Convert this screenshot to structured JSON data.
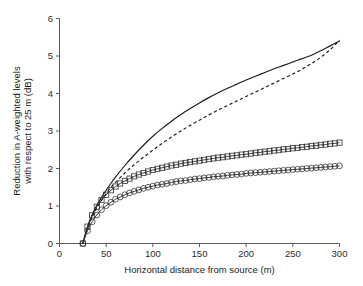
{
  "chart_data": {
    "type": "line",
    "title": "",
    "subtitle": "",
    "xlabel": "Horizontal distance from source (m)",
    "ylabel": "Reduction in A-weighted levels\nwith respect to 25 m (dB)",
    "ylabel_line1": "Reduction in A-weighted levels",
    "ylabel_line2": "with respect to 25 m (dB)",
    "xlim": [
      0,
      300
    ],
    "ylim": [
      0,
      6
    ],
    "xticks": [
      0,
      50,
      100,
      150,
      200,
      250,
      300
    ],
    "yticks": [
      0,
      1,
      2,
      3,
      4,
      5,
      6
    ],
    "xtick_labels": [
      "0",
      "50",
      "100",
      "150",
      "200",
      "250",
      "300"
    ],
    "ytick_labels": [
      "0",
      "1",
      "2",
      "3",
      "4",
      "5",
      "6"
    ],
    "grid": false,
    "legend": "none",
    "axis_color": "#5a5a5a",
    "series": [
      {
        "name": "solid-curve",
        "style": "solid",
        "marker": "none",
        "color": "#1a1a1a",
        "x": [
          25,
          28,
          32,
          36,
          40,
          45,
          50,
          55,
          60,
          70,
          80,
          90,
          100,
          110,
          120,
          130,
          140,
          150,
          160,
          170,
          180,
          190,
          200,
          210,
          220,
          230,
          240,
          250,
          260,
          270,
          280,
          290,
          300
        ],
        "y": [
          0.0,
          0.28,
          0.58,
          0.82,
          1.02,
          1.23,
          1.42,
          1.6,
          1.77,
          2.08,
          2.36,
          2.62,
          2.86,
          3.07,
          3.26,
          3.44,
          3.6,
          3.75,
          3.89,
          4.02,
          4.14,
          4.25,
          4.36,
          4.46,
          4.56,
          4.66,
          4.75,
          4.84,
          4.93,
          5.02,
          5.14,
          5.27,
          5.4
        ]
      },
      {
        "name": "dashed-curve",
        "style": "dashed",
        "marker": "none",
        "color": "#1a1a1a",
        "x": [
          25,
          28,
          32,
          36,
          40,
          45,
          50,
          55,
          60,
          70,
          80,
          90,
          100,
          110,
          120,
          130,
          140,
          150,
          160,
          170,
          180,
          190,
          200,
          210,
          220,
          230,
          240,
          250,
          260,
          270,
          280,
          290,
          300
        ],
        "y": [
          0.0,
          0.25,
          0.53,
          0.76,
          0.95,
          1.15,
          1.33,
          1.49,
          1.63,
          1.88,
          2.1,
          2.3,
          2.49,
          2.67,
          2.84,
          3.0,
          3.15,
          3.29,
          3.43,
          3.56,
          3.68,
          3.8,
          3.92,
          4.04,
          4.16,
          4.28,
          4.4,
          4.52,
          4.65,
          4.8,
          4.97,
          5.17,
          5.42
        ]
      },
      {
        "name": "square-marker-curve",
        "style": "solid",
        "marker": "square",
        "color": "#2a2a2a",
        "x": [
          25,
          30,
          35,
          40,
          45,
          50,
          55,
          60,
          65,
          70,
          75,
          80,
          85,
          90,
          95,
          100,
          105,
          110,
          115,
          120,
          125,
          130,
          135,
          140,
          145,
          150,
          155,
          160,
          165,
          170,
          175,
          180,
          185,
          190,
          195,
          200,
          205,
          210,
          215,
          220,
          225,
          230,
          235,
          240,
          245,
          250,
          255,
          260,
          265,
          270,
          275,
          280,
          285,
          290,
          295,
          300
        ],
        "y": [
          0.0,
          0.45,
          0.75,
          0.98,
          1.16,
          1.3,
          1.42,
          1.52,
          1.6,
          1.67,
          1.73,
          1.79,
          1.84,
          1.88,
          1.92,
          1.96,
          1.99,
          2.02,
          2.05,
          2.08,
          2.1,
          2.13,
          2.15,
          2.17,
          2.19,
          2.21,
          2.23,
          2.25,
          2.27,
          2.29,
          2.3,
          2.32,
          2.34,
          2.35,
          2.37,
          2.38,
          2.4,
          2.42,
          2.43,
          2.45,
          2.46,
          2.48,
          2.49,
          2.51,
          2.52,
          2.54,
          2.55,
          2.57,
          2.58,
          2.6,
          2.61,
          2.63,
          2.64,
          2.66,
          2.67,
          2.69
        ]
      },
      {
        "name": "circle-marker-curve",
        "style": "solid",
        "marker": "circle",
        "color": "#2a2a2a",
        "x": [
          25,
          30,
          35,
          40,
          45,
          50,
          55,
          60,
          65,
          70,
          75,
          80,
          85,
          90,
          95,
          100,
          105,
          110,
          115,
          120,
          125,
          130,
          135,
          140,
          145,
          150,
          155,
          160,
          165,
          170,
          175,
          180,
          185,
          190,
          195,
          200,
          205,
          210,
          215,
          220,
          225,
          230,
          235,
          240,
          245,
          250,
          255,
          260,
          265,
          270,
          275,
          280,
          285,
          290,
          295,
          300
        ],
        "y": [
          0.0,
          0.34,
          0.58,
          0.76,
          0.9,
          1.01,
          1.1,
          1.18,
          1.24,
          1.3,
          1.35,
          1.39,
          1.43,
          1.47,
          1.5,
          1.53,
          1.56,
          1.58,
          1.6,
          1.63,
          1.65,
          1.67,
          1.68,
          1.7,
          1.72,
          1.73,
          1.75,
          1.76,
          1.78,
          1.79,
          1.8,
          1.82,
          1.83,
          1.84,
          1.85,
          1.87,
          1.88,
          1.89,
          1.9,
          1.91,
          1.92,
          1.93,
          1.94,
          1.95,
          1.96,
          1.97,
          1.98,
          1.99,
          2.0,
          2.01,
          2.02,
          2.03,
          2.04,
          2.05,
          2.06,
          2.07
        ]
      }
    ]
  }
}
